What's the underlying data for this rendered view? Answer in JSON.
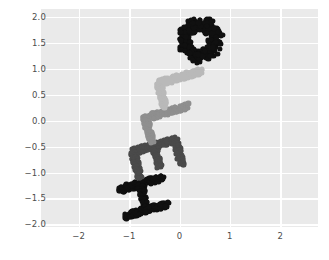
{
  "chart_data": {
    "type": "scatter",
    "title": "",
    "xlabel": "",
    "ylabel": "",
    "xlim": [
      -2.75,
      2.75
    ],
    "ylim": [
      -2.05,
      2.15
    ],
    "grid": true,
    "legend": null,
    "xticks": [
      -2,
      -1,
      0,
      1,
      2
    ],
    "xticklabels": [
      "−2",
      "−1",
      "0",
      "1",
      "2"
    ],
    "yticks": [
      -2.0,
      -1.5,
      -1.0,
      -0.5,
      0.0,
      0.5,
      1.0,
      1.5,
      2.0
    ],
    "yticklabels": [
      "−2.0",
      "−1.5",
      "−1.0",
      "−0.5",
      "0.0",
      "0.5",
      "1.0",
      "1.5",
      "2.0"
    ],
    "marker": "circle",
    "marker_size_px": 5.2,
    "point_count_approx": 980,
    "rotation_deg": -75,
    "letters": [
      {
        "char": "H",
        "color": "#101010",
        "center": [
          -0.72,
          -1.47
        ]
      },
      {
        "char": "E",
        "color": "#4a4a4a",
        "center": [
          -0.44,
          -0.72
        ]
      },
      {
        "char": "L",
        "color": "#8f8f8f",
        "center": [
          -0.2,
          -0.05
        ]
      },
      {
        "char": "L",
        "color": "#b9b9b9",
        "center": [
          0.06,
          0.62
        ]
      },
      {
        "char": "O",
        "color": "#101010",
        "center": [
          0.4,
          1.56
        ]
      }
    ]
  },
  "style": {
    "figure_background": "#ffffff",
    "axes_background": "#eaeaea",
    "gridline_color": "#ffffff",
    "tick_label_color": "#4d4d4d"
  }
}
